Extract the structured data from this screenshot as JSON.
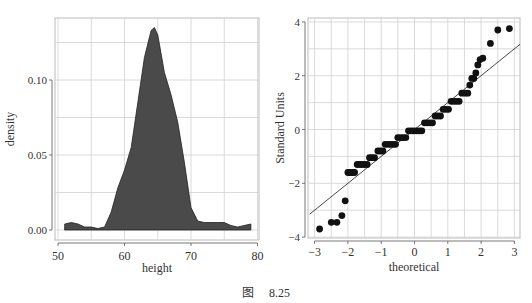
{
  "caption": {
    "figure_label": "图",
    "figure_number": "8.25"
  },
  "colors": {
    "fill": "#4a4a4a",
    "outline": "#222222",
    "grid": "#d0d0d0",
    "points": "#111111",
    "line": "#333333"
  },
  "chart_data": [
    {
      "type": "area",
      "title": "",
      "xlabel": "height",
      "ylabel": "density",
      "xlim": [
        50,
        80
      ],
      "ylim": [
        -0.004,
        0.14
      ],
      "xticks": [
        "50",
        "60",
        "70",
        "80"
      ],
      "yticks": [
        "0.00",
        "0.05",
        "0.10"
      ],
      "grid": true,
      "x": [
        51,
        52,
        53,
        54,
        55,
        56,
        57,
        58,
        59,
        60,
        61,
        62,
        63,
        64,
        64.5,
        65,
        66,
        67,
        68,
        69,
        70,
        71,
        72,
        73,
        74,
        75,
        76,
        77,
        78,
        79
      ],
      "values": [
        0.004,
        0.005,
        0.004,
        0.002,
        0.002,
        0.001,
        0.002,
        0.012,
        0.028,
        0.04,
        0.055,
        0.085,
        0.115,
        0.133,
        0.135,
        0.13,
        0.105,
        0.09,
        0.072,
        0.045,
        0.015,
        0.006,
        0.005,
        0.005,
        0.005,
        0.005,
        0.003,
        0.002,
        0.003,
        0.004
      ]
    },
    {
      "type": "scatter",
      "title": "",
      "xlabel": "theoretical",
      "ylabel": "Standard Units",
      "xlim": [
        -3.1,
        3.15
      ],
      "ylim": [
        -4.05,
        4.1
      ],
      "xticks": [
        "-3",
        "-2",
        "-1",
        "0",
        "1",
        "2",
        "3"
      ],
      "yticks": [
        "-4",
        "-2",
        "0",
        "2",
        "4"
      ],
      "grid": true,
      "reference_line": {
        "slope": 1,
        "intercept": 0
      },
      "points": [
        [
          -2.85,
          -3.7
        ],
        [
          -2.5,
          -3.45
        ],
        [
          -2.33,
          -3.45
        ],
        [
          -2.18,
          -3.2
        ],
        [
          -2.08,
          -2.65
        ],
        [
          -2.0,
          -1.6
        ],
        [
          -1.95,
          -1.6
        ],
        [
          -1.9,
          -1.6
        ],
        [
          -1.85,
          -1.6
        ],
        [
          -1.8,
          -1.6
        ],
        [
          -1.72,
          -1.3
        ],
        [
          -1.65,
          -1.3
        ],
        [
          -1.58,
          -1.3
        ],
        [
          -1.5,
          -1.3
        ],
        [
          -1.42,
          -1.3
        ],
        [
          -1.35,
          -1.05
        ],
        [
          -1.28,
          -1.05
        ],
        [
          -1.2,
          -1.05
        ],
        [
          -1.1,
          -0.8
        ],
        [
          -1.02,
          -0.8
        ],
        [
          -0.95,
          -0.8
        ],
        [
          -0.88,
          -0.55
        ],
        [
          -0.8,
          -0.55
        ],
        [
          -0.72,
          -0.55
        ],
        [
          -0.64,
          -0.55
        ],
        [
          -0.57,
          -0.55
        ],
        [
          -0.5,
          -0.3
        ],
        [
          -0.42,
          -0.3
        ],
        [
          -0.34,
          -0.3
        ],
        [
          -0.26,
          -0.3
        ],
        [
          -0.18,
          -0.05
        ],
        [
          -0.1,
          -0.05
        ],
        [
          -0.02,
          -0.05
        ],
        [
          0.06,
          -0.05
        ],
        [
          0.14,
          -0.05
        ],
        [
          0.22,
          -0.05
        ],
        [
          0.3,
          0.25
        ],
        [
          0.38,
          0.25
        ],
        [
          0.46,
          0.25
        ],
        [
          0.54,
          0.25
        ],
        [
          0.62,
          0.5
        ],
        [
          0.7,
          0.5
        ],
        [
          0.78,
          0.5
        ],
        [
          0.86,
          0.75
        ],
        [
          0.94,
          0.75
        ],
        [
          1.02,
          0.75
        ],
        [
          1.1,
          1.05
        ],
        [
          1.18,
          1.05
        ],
        [
          1.26,
          1.05
        ],
        [
          1.34,
          1.05
        ],
        [
          1.42,
          1.35
        ],
        [
          1.52,
          1.35
        ],
        [
          1.6,
          1.35
        ],
        [
          1.66,
          1.65
        ],
        [
          1.72,
          1.9
        ],
        [
          1.78,
          1.9
        ],
        [
          1.84,
          2.1
        ],
        [
          1.9,
          2.4
        ],
        [
          1.97,
          2.6
        ],
        [
          2.05,
          2.65
        ],
        [
          2.28,
          3.2
        ],
        [
          2.5,
          3.7
        ],
        [
          2.85,
          3.75
        ]
      ]
    }
  ]
}
